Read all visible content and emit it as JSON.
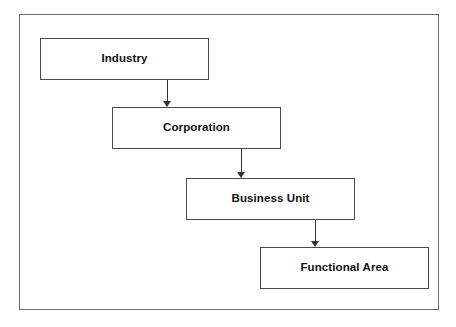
{
  "diagram": {
    "type": "hierarchy-flow",
    "title": "",
    "frame": {
      "border_color": "#6b6b6b",
      "background": "#ffffff"
    },
    "node_border_color": "#4a4a4a",
    "arrow_color": "#333333",
    "text_color": "#111111",
    "nodes": [
      {
        "id": "industry",
        "label": "Industry",
        "level": 1
      },
      {
        "id": "corporation",
        "label": "Corporation",
        "level": 2
      },
      {
        "id": "business-unit",
        "label": "Business Unit",
        "level": 3
      },
      {
        "id": "functional-area",
        "label": "Functional Area",
        "level": 4
      }
    ],
    "edges": [
      {
        "from": "industry",
        "to": "corporation",
        "direction": "down",
        "arrowhead": "filled"
      },
      {
        "from": "corporation",
        "to": "business-unit",
        "direction": "down",
        "arrowhead": "filled"
      },
      {
        "from": "business-unit",
        "to": "functional-area",
        "direction": "down",
        "arrowhead": "filled"
      }
    ]
  }
}
